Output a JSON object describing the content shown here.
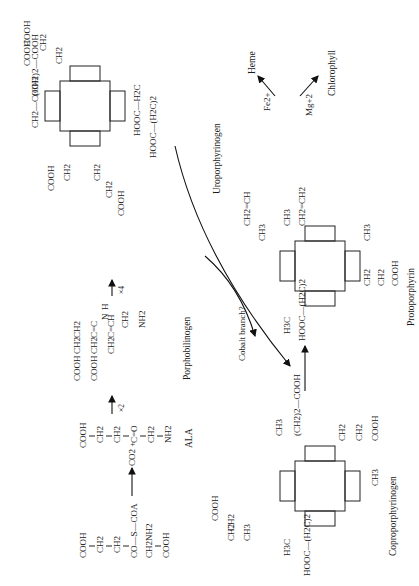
{
  "diagram": {
    "orientation": "rotated 90deg counter-clockwise",
    "compounds": {
      "succinyl_coa": {
        "lines": [
          "COOH",
          "CH2",
          "CH2",
          "CO—S—COA"
        ],
        "glycine": [
          "CH2NH2",
          "COOH"
        ]
      },
      "ala": {
        "name": "ALA",
        "lines": [
          "COOH",
          "CH2",
          "CH2",
          "C=O",
          "CH2",
          "NH2"
        ]
      },
      "co2": "CO2 +",
      "porphobilinogen": {
        "name": "Porphobilinogen",
        "sidechains": [
          "COOH",
          "COOH",
          "CH2",
          "CH2",
          "CH2",
          "CH2",
          "C=CH",
          "C=C",
          "N",
          "H",
          "CH2",
          "NH2"
        ]
      },
      "uroporphyrinogen": {
        "name": "Uroporphyrinogen",
        "substituents": [
          "CH2—COOH",
          "(CH2)2—COOH",
          "HOOC—H2C",
          "HOOC—(H2C)2",
          "COOH",
          "CH2",
          "COOH",
          "CH2",
          "CH2",
          "COOH",
          "CH2",
          "CH2",
          "COOH"
        ]
      },
      "coproporphyrinogen": {
        "name": "Coproporphyrinogen",
        "substituents": [
          "CH3",
          "(CH2)2—COOH",
          "H3C",
          "HOOC—(H2C)2",
          "CH3",
          "CH2",
          "CH2",
          "COOH",
          "CH3",
          "CH2",
          "CH2",
          "COOH"
        ]
      },
      "protoporphyrin": {
        "name": "Protoporphyrin",
        "substituents": [
          "CH3",
          "CH2=CH2",
          "H3C",
          "HOOC—(H2C)2",
          "CH2=CH",
          "CH3",
          "CH3",
          "CH2",
          "CH2",
          "COOH"
        ]
      },
      "heme": {
        "name": "Heme",
        "ion": "Fe2+"
      },
      "chlorophyll": {
        "name": "Chlorophyll",
        "ion": "Mg+2"
      }
    },
    "arrows": {
      "times2": "×2",
      "times4": "×4",
      "cobalt": "Cobalt branch?"
    }
  }
}
